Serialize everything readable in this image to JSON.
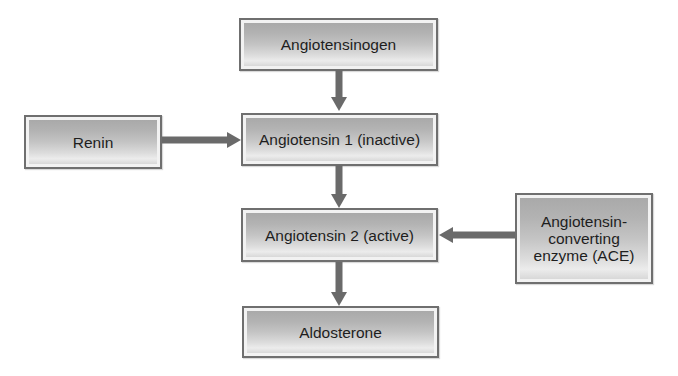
{
  "diagram": {
    "type": "flowchart",
    "colors": {
      "box_border": "#6f6f6f",
      "box_fill_top": "#a9a9a9",
      "box_fill_bottom": "#ececec",
      "arrow": "#6a6a6a",
      "text": "#1e1e1e"
    },
    "nodes": {
      "angiotensinogen": {
        "label": "Angiotensinogen"
      },
      "renin": {
        "label": "Renin"
      },
      "angiotensin1": {
        "label": "Angiotensin 1 (inactive)"
      },
      "angiotensin2": {
        "label": "Angiotensin 2 (active)"
      },
      "ace": {
        "label_line1": "Angiotensin-",
        "label_line2": "converting",
        "label_line3": "enzyme (ACE)"
      },
      "aldosterone": {
        "label": "Aldosterone"
      }
    },
    "edges": [
      {
        "from": "Angiotensinogen",
        "to": "Angiotensin 1 (inactive)",
        "direction": "down"
      },
      {
        "from": "Renin",
        "to": "Angiotensin 1 (inactive)",
        "direction": "right"
      },
      {
        "from": "Angiotensin 1 (inactive)",
        "to": "Angiotensin 2 (active)",
        "direction": "down"
      },
      {
        "from": "Angiotensin-converting enzyme (ACE)",
        "to": "Angiotensin 2 (active)",
        "direction": "left"
      },
      {
        "from": "Angiotensin 2 (active)",
        "to": "Aldosterone",
        "direction": "down"
      }
    ]
  }
}
